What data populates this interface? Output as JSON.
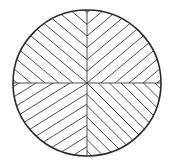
{
  "figure": {
    "colors": {
      "background": "#ffffff",
      "stroke": "#2a2a2a",
      "hatch": "#3a3a3a"
    },
    "circle": {
      "cx": 87,
      "cy": 83,
      "rx": 74,
      "ry": 73
    },
    "axes": {
      "vertical_x": 87,
      "horizontal_y": 83
    },
    "quadrants": [
      {
        "name": "top-left",
        "direction": "backslash",
        "angle_deg": 40,
        "spacing": 9
      },
      {
        "name": "top-right",
        "direction": "slash",
        "angle_deg": -40,
        "spacing": 9
      },
      {
        "name": "bottom-left",
        "direction": "slash",
        "angle_deg": -32,
        "spacing": 9
      },
      {
        "name": "bottom-right",
        "direction": "backslash",
        "angle_deg": 45,
        "spacing": 8
      }
    ]
  }
}
